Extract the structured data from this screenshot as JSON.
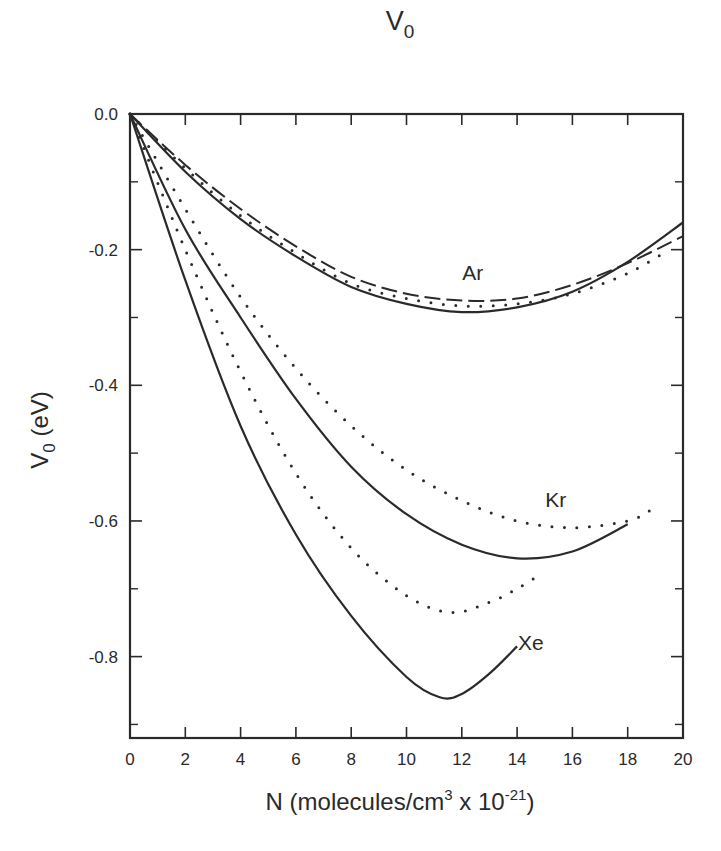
{
  "chart_data": {
    "type": "line",
    "title": "V",
    "title_subscript": "0",
    "xlabel": "N (molecules/cm",
    "xlabel_sup1": "3",
    "xlabel_mid": " x 10",
    "xlabel_sup2": "-21",
    "xlabel_end": ")",
    "ylabel": "V",
    "ylabel_subscript": "0",
    "ylabel_unit": " (eV)",
    "xlim": [
      0,
      20
    ],
    "ylim": [
      -0.92,
      0.0
    ],
    "x_ticks": [
      0,
      2,
      4,
      6,
      8,
      10,
      12,
      14,
      16,
      18,
      20
    ],
    "x_tick_labels": [
      "0",
      "2",
      "4",
      "6",
      "8",
      "10",
      "12",
      "14",
      "16",
      "18",
      "20"
    ],
    "y_ticks": [
      0.0,
      -0.2,
      -0.4,
      -0.6,
      -0.8
    ],
    "y_tick_labels": [
      "0.0",
      "-0.2",
      "-0.4",
      "-0.6",
      "-0.8"
    ],
    "y_minor_ticks": [
      -0.1,
      -0.3,
      -0.5,
      -0.7,
      -0.9
    ],
    "grid": false,
    "legend": null,
    "annotations": [
      {
        "text": "Ar",
        "x": 12.4,
        "y": -0.245
      },
      {
        "text": "Kr",
        "x": 15.4,
        "y": -0.58
      },
      {
        "text": "Xe",
        "x": 14.5,
        "y": -0.79
      }
    ],
    "series": [
      {
        "name": "Ar (solid)",
        "gas": "Ar",
        "style": "solid",
        "x": [
          0,
          2,
          4,
          6,
          8,
          10,
          12,
          14,
          16,
          18,
          20
        ],
        "y": [
          0,
          -0.085,
          -0.155,
          -0.21,
          -0.255,
          -0.28,
          -0.292,
          -0.285,
          -0.262,
          -0.218,
          -0.16
        ]
      },
      {
        "name": "Ar (dashed)",
        "gas": "Ar",
        "style": "dashed",
        "x": [
          0,
          2,
          4,
          6,
          8,
          10,
          12,
          14,
          16,
          18,
          20
        ],
        "y": [
          0,
          -0.075,
          -0.14,
          -0.195,
          -0.24,
          -0.265,
          -0.275,
          -0.272,
          -0.252,
          -0.22,
          -0.18
        ]
      },
      {
        "name": "Ar (dotted)",
        "gas": "Ar",
        "style": "dotted",
        "x": [
          0,
          2,
          4,
          6,
          8,
          10,
          12,
          14,
          16,
          18,
          19.5
        ],
        "y": [
          0,
          -0.08,
          -0.15,
          -0.205,
          -0.25,
          -0.272,
          -0.283,
          -0.28,
          -0.265,
          -0.235,
          -0.2
        ]
      },
      {
        "name": "Kr (solid)",
        "gas": "Kr",
        "style": "solid",
        "x": [
          0,
          2,
          4,
          6,
          8,
          10,
          12,
          14,
          16,
          18
        ],
        "y": [
          0,
          -0.17,
          -0.3,
          -0.42,
          -0.52,
          -0.59,
          -0.635,
          -0.655,
          -0.645,
          -0.605
        ]
      },
      {
        "name": "Kr (dotted)",
        "gas": "Kr",
        "style": "dotted",
        "x": [
          0,
          2,
          4,
          6,
          8,
          10,
          12,
          14,
          16,
          18,
          18.8
        ],
        "y": [
          0,
          -0.14,
          -0.27,
          -0.375,
          -0.46,
          -0.525,
          -0.57,
          -0.6,
          -0.61,
          -0.6,
          -0.585
        ]
      },
      {
        "name": "Xe (solid)",
        "gas": "Xe",
        "style": "solid",
        "x": [
          0,
          2,
          4,
          6,
          8,
          10,
          11.2,
          12,
          13,
          14
        ],
        "y": [
          0,
          -0.245,
          -0.46,
          -0.62,
          -0.74,
          -0.83,
          -0.86,
          -0.855,
          -0.825,
          -0.785
        ]
      },
      {
        "name": "Xe (dotted)",
        "gas": "Xe",
        "style": "dotted",
        "x": [
          0,
          2,
          4,
          6,
          8,
          10,
          11.6,
          13,
          14,
          14.8
        ],
        "y": [
          0,
          -0.2,
          -0.38,
          -0.53,
          -0.64,
          -0.71,
          -0.735,
          -0.72,
          -0.7,
          -0.68
        ]
      }
    ]
  }
}
